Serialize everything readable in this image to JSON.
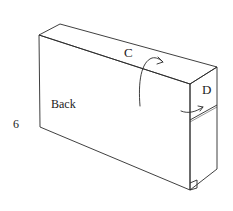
{
  "figure": {
    "step_number": "6",
    "labels": {
      "top_face": "C",
      "end_face": "D",
      "back_face": "Back"
    },
    "arrows": [
      {
        "name": "fold-arrow-c",
        "meaning": "fold up onto top face C"
      },
      {
        "name": "fold-arrow-d",
        "meaning": "fold onto end face D"
      }
    ],
    "colors": {
      "line": "#2a2a2a",
      "text": "#222222",
      "background": "#ffffff"
    }
  }
}
